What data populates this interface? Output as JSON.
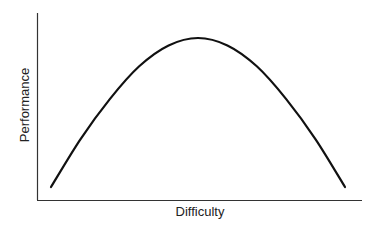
{
  "chart_data": {
    "type": "line",
    "title": "",
    "xlabel": "Difficulty",
    "ylabel": "Performance",
    "grid": false,
    "legend": null,
    "x_ticks": [],
    "y_ticks": [],
    "series": [
      {
        "name": "Performance vs Difficulty (inverted U)",
        "x": [
          0,
          0.1,
          0.2,
          0.3,
          0.4,
          0.5,
          0.6,
          0.7,
          0.8,
          0.9,
          1.0
        ],
        "values": [
          0.0,
          0.32,
          0.59,
          0.81,
          0.95,
          1.0,
          0.95,
          0.81,
          0.59,
          0.32,
          0.0
        ]
      }
    ],
    "xlim": [
      0,
      1
    ],
    "ylim": [
      0,
      1
    ],
    "color": "#111111"
  }
}
